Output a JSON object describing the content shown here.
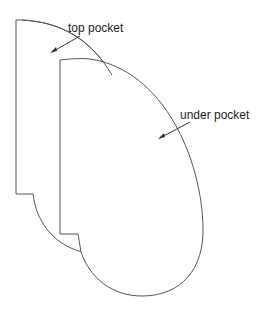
{
  "diagram": {
    "labels": {
      "top_pocket": "top pocket",
      "under_pocket": "under pocket"
    },
    "colors": {
      "stroke": "#555555",
      "text": "#222222",
      "background": "#ffffff"
    }
  }
}
